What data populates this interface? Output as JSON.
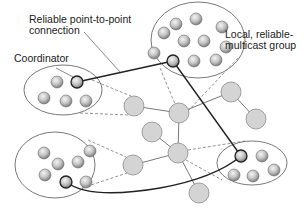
{
  "labels": {
    "connection": [
      "Reliable point-to-point",
      "connection"
    ],
    "coordinator": "Coordinator",
    "group": [
      "Local, reliable-",
      "multicast group"
    ]
  },
  "colors": {
    "background": "#ffffff",
    "network_node_fill": "#d4d4d4",
    "network_node_stroke": "#8a8a8a",
    "member_fill_light": "#e8e8e8",
    "member_fill_dark": "#8c8c8c",
    "coordinator_stroke": "#222222",
    "connection_line": "#222222",
    "dashed_line": "#7a7a7a",
    "ellipse_stroke": "#6a6a6a"
  },
  "groups": [
    {
      "name": "group-top-left",
      "ellipse": {
        "cx": 63,
        "cy": 90,
        "rx": 39,
        "ry": 25
      },
      "members": [
        [
          57,
          82
        ],
        [
          44,
          98
        ],
        [
          66,
          101
        ],
        [
          86,
          101
        ]
      ],
      "coordinator": [
        77,
        82
      ]
    },
    {
      "name": "group-top-center",
      "ellipse": {
        "cx": 198,
        "cy": 40,
        "rx": 47,
        "ry": 38
      },
      "members": [
        [
          176,
          24
        ],
        [
          196,
          19
        ],
        [
          163,
          40
        ],
        [
          184,
          40
        ],
        [
          204,
          40
        ],
        [
          224,
          46
        ],
        [
          154,
          53
        ],
        [
          194,
          61
        ],
        [
          217,
          60
        ],
        [
          164,
          30
        ]
      ],
      "coordinator": [
        173,
        61
      ]
    },
    {
      "name": "group-bottom-left",
      "ellipse": {
        "cx": 55,
        "cy": 165,
        "rx": 40,
        "ry": 33
      },
      "members": [
        [
          44,
          153
        ],
        [
          58,
          164
        ],
        [
          78,
          162
        ],
        [
          90,
          151
        ],
        [
          45,
          175
        ],
        [
          86,
          182
        ]
      ],
      "coordinator": [
        66,
        182
      ]
    },
    {
      "name": "group-bottom-right",
      "ellipse": {
        "cx": 252,
        "cy": 163,
        "rx": 35,
        "ry": 22
      },
      "members": [
        [
          262,
          156
        ],
        [
          274,
          170
        ],
        [
          234,
          175
        ],
        [
          253,
          176
        ]
      ],
      "coordinator": [
        241,
        156
      ]
    }
  ],
  "network_nodes": [
    {
      "id": "A",
      "x": 134,
      "y": 106
    },
    {
      "id": "B",
      "x": 179,
      "y": 113
    },
    {
      "id": "C",
      "x": 152,
      "y": 132
    },
    {
      "id": "D",
      "x": 178,
      "y": 153
    },
    {
      "id": "E",
      "x": 133,
      "y": 165
    },
    {
      "id": "F",
      "x": 199,
      "y": 193
    },
    {
      "id": "G",
      "x": 231,
      "y": 92
    },
    {
      "id": "H",
      "x": 256,
      "y": 119
    }
  ],
  "network_edges": [
    [
      "A",
      "B"
    ],
    [
      "B",
      "G"
    ],
    [
      "G",
      "H"
    ],
    [
      "B",
      "D"
    ],
    [
      "C",
      "D"
    ],
    [
      "D",
      "E"
    ],
    [
      "D",
      "F"
    ]
  ]
}
